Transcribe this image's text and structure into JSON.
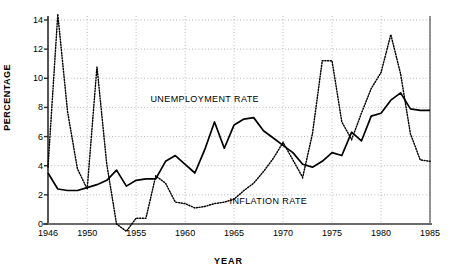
{
  "chart_data": {
    "type": "line",
    "title": "",
    "xlabel": "YEAR",
    "ylabel": "PERCENTAGE",
    "xlim": [
      1946,
      1985
    ],
    "ylim": [
      0,
      14
    ],
    "ytick_values": [
      0,
      2,
      4,
      6,
      8,
      10,
      12,
      14
    ],
    "ytick_labels": [
      "0",
      "2",
      "4",
      "6",
      "8",
      "10",
      "12",
      "14"
    ],
    "xtick_values": [
      1946,
      1950,
      1955,
      1960,
      1965,
      1970,
      1975,
      1980,
      1985
    ],
    "xtick_labels": [
      "1946",
      "1950",
      "1955",
      "1960",
      "1965",
      "1970",
      "1975",
      "1980",
      "1985"
    ],
    "grid": "dotted both axes",
    "legend_position": "inline annotations on curves",
    "x": [
      1946,
      1947,
      1948,
      1949,
      1950,
      1951,
      1952,
      1953,
      1954,
      1955,
      1956,
      1957,
      1958,
      1959,
      1960,
      1961,
      1962,
      1963,
      1964,
      1965,
      1966,
      1967,
      1968,
      1969,
      1970,
      1971,
      1972,
      1973,
      1974,
      1975,
      1976,
      1977,
      1978,
      1979,
      1980,
      1981,
      1982,
      1983,
      1984,
      1985
    ],
    "series": [
      {
        "name": "UNEMPLOYMENT RATE",
        "style": "solid",
        "color": "#000000",
        "values": [
          3.5,
          2.4,
          2.3,
          2.4,
          2.6,
          2.9,
          3.2,
          3.7,
          2.6,
          3.1,
          3.1,
          4.0,
          4.7,
          4.4,
          3.5,
          4.3,
          5.8,
          7.0,
          5.1,
          6.2,
          7.2,
          7.3,
          6.4,
          6.0,
          5.3,
          4.9,
          4.4,
          3.9,
          3.8,
          4.2,
          4.5,
          4.9,
          4.6,
          5.4,
          6.0,
          6.6,
          6.6,
          6.2,
          5.7,
          7.4
        ],
        "values_note": "see series_points for year-paired data"
      },
      {
        "name": "INFLATION RATE",
        "style": "dotted",
        "color": "#000000",
        "values": [
          3.9,
          14.4,
          7.7,
          3.8,
          2.4,
          10.8,
          4.1,
          0.0,
          -0.5,
          0.4,
          0.4,
          3.3,
          2.8,
          1.5,
          1.4,
          1.1,
          1.2,
          1.4,
          1.5,
          1.7,
          2.3,
          2.8,
          3.6,
          4.5,
          5.6,
          4.4,
          3.2,
          6.2,
          11.2,
          11.2,
          7.0,
          5.8,
          7.6,
          9.3,
          10.4,
          13.0,
          10.3,
          6.2,
          4.4,
          4.3
        ]
      }
    ],
    "series_points": {
      "unemployment": [
        [
          1946,
          3.5
        ],
        [
          1947,
          2.4
        ],
        [
          1948,
          2.3
        ],
        [
          1949,
          2.4
        ],
        [
          1950,
          2.6
        ],
        [
          1951,
          2.9
        ],
        [
          1952,
          3.2
        ],
        [
          1953,
          3.7
        ],
        [
          1954,
          2.6
        ],
        [
          1955,
          3.1
        ],
        [
          1956,
          3.1
        ],
        [
          1957,
          4.0
        ],
        [
          1958,
          4.7
        ],
        [
          1959,
          4.4
        ],
        [
          1960,
          3.5
        ],
        [
          1961,
          4.3
        ],
        [
          1962,
          5.8
        ],
        [
          1963,
          7.0
        ],
        [
          1964,
          5.1
        ],
        [
          1965,
          6.2
        ],
        [
          1966,
          7.2
        ],
        [
          1967,
          7.3
        ],
        [
          1968,
          6.4
        ],
        [
          1969,
          6.0
        ],
        [
          1970,
          5.3
        ],
        [
          1971,
          4.9
        ],
        [
          1972,
          4.4
        ],
        [
          1973,
          3.9
        ],
        [
          1974,
          3.8
        ],
        [
          1975,
          4.2
        ],
        [
          1976,
          4.8
        ],
        [
          1977,
          5.9
        ],
        [
          1978,
          6.6
        ],
        [
          1979,
          6.5
        ],
        [
          1980,
          6.2
        ],
        [
          1981,
          5.7
        ],
        [
          1982,
          7.4
        ],
        [
          1983,
          7.6
        ],
        [
          1984,
          8.3
        ],
        [
          1985,
          9.0
        ]
      ],
      "unemployment_full": [
        [
          1946,
          3.5
        ],
        [
          1947,
          2.4
        ],
        [
          1948,
          2.3
        ],
        [
          1949,
          2.3
        ],
        [
          1950,
          2.5
        ],
        [
          1951,
          2.7
        ],
        [
          1952,
          3.0
        ],
        [
          1953,
          3.7
        ],
        [
          1954,
          2.6
        ],
        [
          1955,
          3.0
        ],
        [
          1956,
          3.1
        ],
        [
          1957,
          3.1
        ],
        [
          1958,
          4.3
        ],
        [
          1959,
          4.7
        ],
        [
          1960,
          4.1
        ],
        [
          1961,
          3.5
        ],
        [
          1962,
          5.1
        ],
        [
          1963,
          7.0
        ],
        [
          1964,
          5.2
        ],
        [
          1965,
          6.8
        ],
        [
          1966,
          7.2
        ],
        [
          1967,
          7.3
        ],
        [
          1968,
          6.4
        ],
        [
          1969,
          5.9
        ],
        [
          1970,
          5.4
        ],
        [
          1971,
          4.9
        ],
        [
          1972,
          4.1
        ],
        [
          1973,
          3.9
        ],
        [
          1974,
          4.3
        ],
        [
          1975,
          4.9
        ],
        [
          1976,
          4.7
        ],
        [
          1977,
          6.3
        ],
        [
          1978,
          5.7
        ],
        [
          1979,
          7.4
        ],
        [
          1980,
          7.6
        ],
        [
          1981,
          8.5
        ],
        [
          1982,
          9.0
        ],
        [
          1983,
          7.9
        ],
        [
          1984,
          7.8
        ],
        [
          1985,
          7.8
        ]
      ],
      "inflation": [
        [
          1946,
          3.9
        ],
        [
          1947,
          14.4
        ],
        [
          1948,
          7.7
        ],
        [
          1949,
          3.8
        ],
        [
          1950,
          2.4
        ],
        [
          1951,
          10.8
        ],
        [
          1952,
          4.1
        ],
        [
          1953,
          0.0
        ],
        [
          1954,
          -0.5
        ],
        [
          1955,
          0.4
        ],
        [
          1956,
          0.4
        ],
        [
          1957,
          3.3
        ],
        [
          1958,
          2.8
        ],
        [
          1959,
          1.5
        ],
        [
          1960,
          1.4
        ],
        [
          1961,
          1.1
        ],
        [
          1962,
          1.2
        ],
        [
          1963,
          1.4
        ],
        [
          1964,
          1.5
        ],
        [
          1965,
          1.7
        ],
        [
          1966,
          2.3
        ],
        [
          1967,
          2.8
        ],
        [
          1968,
          3.6
        ],
        [
          1969,
          4.5
        ],
        [
          1970,
          5.6
        ],
        [
          1971,
          4.4
        ],
        [
          1972,
          3.2
        ],
        [
          1973,
          6.2
        ],
        [
          1974,
          11.2
        ],
        [
          1975,
          11.2
        ],
        [
          1976,
          7.0
        ],
        [
          1977,
          5.8
        ],
        [
          1978,
          7.6
        ],
        [
          1979,
          9.3
        ],
        [
          1980,
          10.4
        ],
        [
          1981,
          13.0
        ],
        [
          1982,
          10.3
        ],
        [
          1983,
          6.2
        ],
        [
          1984,
          4.4
        ],
        [
          1985,
          4.3
        ]
      ]
    },
    "annotations": [
      {
        "text": "UNEMPLOYMENT RATE",
        "x": 1962.0,
        "y": 8.6
      },
      {
        "text": "INFLATION RATE",
        "x": 1968.5,
        "y": 1.55
      }
    ]
  }
}
